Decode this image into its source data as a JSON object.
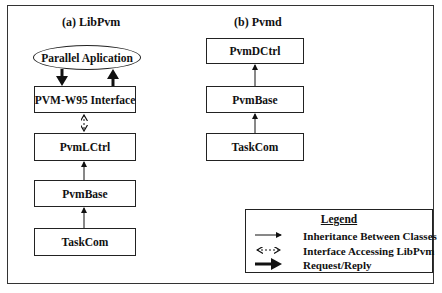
{
  "figure": {
    "panels": [
      {
        "title": "(a) LibPvm",
        "top_node": "Parallel Aplication",
        "boxes": [
          "PVM-W95 Interface",
          "PvmLCtrl",
          "PvmBase",
          "TaskCom"
        ]
      },
      {
        "title": "(b) Pvmd",
        "boxes": [
          "PvmDCtrl",
          "PvmBase",
          "TaskCom"
        ]
      }
    ],
    "legend": {
      "title": "Legend",
      "items": [
        {
          "symbol": "thin-solid-arrow",
          "label": "Inheritance Between  Classes"
        },
        {
          "symbol": "dashed-double-arrow",
          "label": "Interface Accessing LibPvm"
        },
        {
          "symbol": "thick-arrow",
          "label": "Request/Reply"
        }
      ]
    }
  }
}
